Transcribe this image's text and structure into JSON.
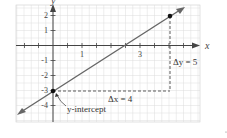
{
  "chart_data": {
    "type": "line",
    "title": "",
    "xlabel": "x",
    "ylabel": "y",
    "xlim": [
      -1.3,
      5.0
    ],
    "ylim": [
      -5.1,
      2.7
    ],
    "grid": true,
    "x_tick_labels": [
      "1",
      "3"
    ],
    "y_tick_labels": [
      "2",
      "1",
      "-1",
      "-2",
      "-3",
      "-4"
    ],
    "series": [
      {
        "name": "line",
        "slope": 1.25,
        "intercept": -3,
        "x": [
          -1.2,
          4.5
        ],
        "y": [
          -4.5,
          2.625
        ]
      }
    ],
    "points": [
      {
        "x": 0,
        "y": -3,
        "label": "y-intercept"
      },
      {
        "x": 4,
        "y": 2
      }
    ],
    "annotations": [
      {
        "text": "y-intercept",
        "at": [
          0,
          -3
        ]
      },
      {
        "text": "Δx = 4",
        "from": [
          0,
          -3
        ],
        "to": [
          4,
          -3
        ]
      },
      {
        "text": "Δy = 5",
        "from": [
          4,
          -3
        ],
        "to": [
          4,
          2
        ]
      }
    ]
  },
  "labels": {
    "x_axis": "x",
    "y_axis": "y",
    "tick_x_1": "1",
    "tick_x_3": "3",
    "tick_y_2": "2",
    "tick_y_1": "1",
    "tick_y_m1": "-1",
    "tick_y_m2": "-2",
    "tick_y_m3": "-3",
    "tick_y_m4": "-4",
    "y_intercept": "y-intercept",
    "delta_x": "Δx = 4",
    "delta_y": "Δy = 5"
  }
}
